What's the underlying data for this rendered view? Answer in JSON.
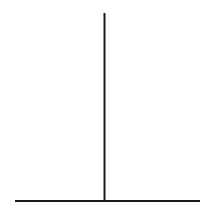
{
  "diagram": {
    "type": "inverted-t",
    "stroke_color": "#1a1a1a",
    "background": "#ffffff",
    "vertical_line": {
      "x1": 104.5,
      "y1": 13,
      "x2": 104.5,
      "y2": 201
    },
    "horizontal_line": {
      "x1": 15,
      "y1": 201,
      "x2": 200,
      "y2": 201
    }
  }
}
